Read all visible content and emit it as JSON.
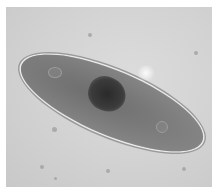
{
  "image": {
    "subject": "paramecium under light microscope",
    "background_color": "#d4d4d4",
    "cell_color": "#7a7a7a",
    "nucleus_color": "#333333"
  }
}
